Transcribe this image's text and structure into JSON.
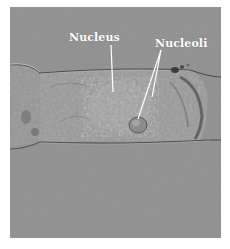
{
  "figure": {
    "type": "micrograph",
    "labels": [
      {
        "id": "nucleus",
        "text": "Nucleus"
      },
      {
        "id": "nucleoli",
        "text": "Nucleoli"
      }
    ]
  },
  "colors": {
    "background": "#ffffff",
    "photo_gray": "#939393",
    "label_color": "#ffffff"
  }
}
